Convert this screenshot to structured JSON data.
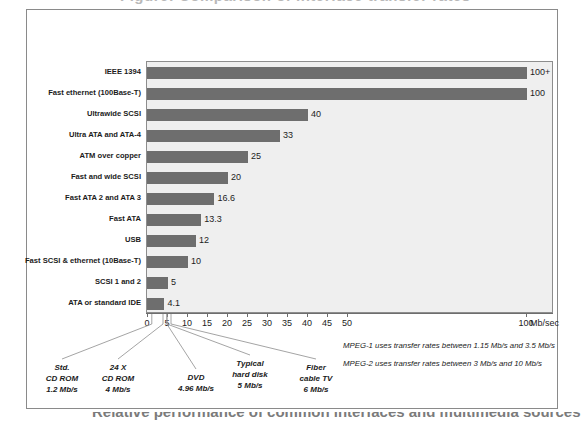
{
  "figure": {
    "top_cut_text": "Figure: Comparison of interface transfer rates",
    "bottom_cut_text": "Relative performance of common interfaces and multimedia sources"
  },
  "chart_data": {
    "type": "bar",
    "orientation": "horizontal",
    "title": "",
    "xlabel": "Mb/sec",
    "ylabel": "",
    "xlim": [
      0,
      100
    ],
    "xticks": [
      0,
      5,
      10,
      15,
      20,
      25,
      30,
      35,
      40,
      45,
      50,
      100
    ],
    "xticklabels": [
      "0",
      "5",
      "10",
      "15",
      "20",
      "25",
      "30",
      "35",
      "40",
      "45",
      "50",
      "100"
    ],
    "axis_break_after": 50,
    "grid": false,
    "legend": "none",
    "unit": "Mb/sec",
    "categories": [
      "IEEE 1394",
      "Fast ethernet (100Base-T)",
      "Ultrawide SCSI",
      "Ultra ATA and ATA-4",
      "ATM over copper",
      "Fast and wide SCSI",
      "Fast ATA 2 and ATA 3",
      "Fast ATA",
      "USB",
      "Fast SCSI & ethernet (10Base-T)",
      "SCSI 1 and 2",
      "ATA or standard IDE"
    ],
    "values": [
      100,
      100,
      40,
      33,
      25,
      20,
      16.6,
      13.3,
      12,
      10,
      5,
      4.1
    ],
    "value_labels": [
      "100+",
      "100",
      "40",
      "33",
      "25",
      "20",
      "16.6",
      "13.3",
      "12",
      "10",
      "5",
      "4.1"
    ],
    "annotations": [
      {
        "lines": [
          "Std.",
          "CD ROM",
          "1.2 Mb/s"
        ],
        "value": 1.2
      },
      {
        "lines": [
          "24 X",
          "CD ROM",
          "4 Mb/s"
        ],
        "value": 4
      },
      {
        "lines": [
          "DVD",
          "4.96 Mb/s"
        ],
        "value": 4.96
      },
      {
        "lines": [
          "Typical",
          "hard disk",
          "5 Mb/s"
        ],
        "value": 5
      },
      {
        "lines": [
          "Fiber",
          "cable TV",
          "6 Mb/s"
        ],
        "value": 6
      }
    ],
    "notes": [
      "MPEG-1 uses transfer rates between 1.15 Mb/s and 3.5 Mb/s",
      "MPEG-2 uses transfer rates between 3 Mb/s and 10 Mb/s"
    ]
  },
  "colors": {
    "bar": "#6e6e6e",
    "plot_background": "#efefef",
    "frame": "#8a8a8a",
    "axis": "#6d6d6d",
    "text": "#1b1b1b"
  }
}
